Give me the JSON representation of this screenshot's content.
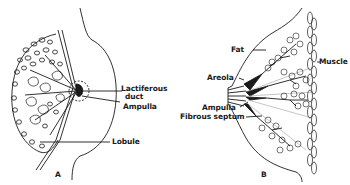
{
  "figure": {
    "panel_a": {
      "label": "A",
      "annotations": {
        "lactiferous_duct": "Lactiferous\nduct",
        "lactiferous_line1": "Lactiferous",
        "lactiferous_line2": "duct",
        "ampulla": "Ampulla",
        "lobule": "Lobule"
      }
    },
    "panel_b": {
      "label": "B",
      "annotations": {
        "fat": "Fat",
        "muscle": "Muscle",
        "areola": "Areola",
        "ampulla": "Ampulla",
        "fibrous_septum": "Fibrous septum"
      }
    },
    "colors": {
      "ink": "#1a1a1a",
      "background": "#ffffff"
    }
  }
}
